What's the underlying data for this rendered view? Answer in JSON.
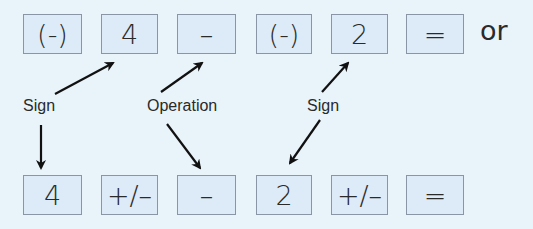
{
  "top_row": {
    "keys": [
      "(-)",
      "4",
      "–",
      "(-)",
      "2",
      "="
    ],
    "trailing_text": "or"
  },
  "bottom_row": {
    "keys": [
      "4",
      "+/–",
      "–",
      "2",
      "+/–",
      "="
    ]
  },
  "labels": {
    "sign_left": "Sign",
    "operation": "Operation",
    "sign_right": "Sign"
  },
  "colors": {
    "background": "#e8f3fa",
    "key_fill": "#dcebf7",
    "key_border": "#8a96a6",
    "arrow": "#111111"
  }
}
